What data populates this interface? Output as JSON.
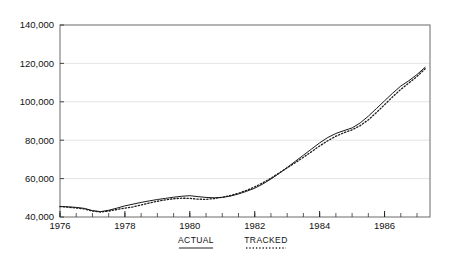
{
  "chart_data": {
    "type": "line",
    "title": "",
    "subtitle": "",
    "xlabel": "",
    "ylabel": "",
    "xlim": [
      1976.0,
      1987.4
    ],
    "ylim": [
      40000,
      140000
    ],
    "grid": true,
    "grid_axis": "y",
    "legend_position": "below-axis",
    "y_ticks": [
      40000,
      60000,
      80000,
      100000,
      120000,
      140000
    ],
    "y_tick_labels": [
      "40,000",
      "60,000",
      "80,000",
      "100,000",
      "120,000",
      "140,000"
    ],
    "x_ticks": [
      1976,
      1978,
      1980,
      1982,
      1984,
      1986
    ],
    "x_tick_labels": [
      "1976",
      "1978",
      "1980",
      "1982",
      "1984",
      "1986"
    ],
    "x_minor_tick_interval": 0.5,
    "series": [
      {
        "name": "ACTUAL",
        "style": "solid",
        "color": "#1a1a1a",
        "x": [
          1976.0,
          1976.25,
          1976.5,
          1976.75,
          1977.0,
          1977.25,
          1977.5,
          1977.75,
          1978.0,
          1978.25,
          1978.5,
          1978.75,
          1979.0,
          1979.25,
          1979.5,
          1979.75,
          1980.0,
          1980.25,
          1980.5,
          1980.75,
          1981.0,
          1981.25,
          1981.5,
          1981.75,
          1982.0,
          1982.25,
          1982.5,
          1982.75,
          1983.0,
          1983.25,
          1983.5,
          1983.75,
          1984.0,
          1984.25,
          1984.5,
          1984.75,
          1985.0,
          1985.25,
          1985.5,
          1985.75,
          1986.0,
          1986.25,
          1986.5,
          1986.75,
          1987.0,
          1987.25
        ],
        "values": [
          45500,
          45300,
          45000,
          44500,
          43300,
          42800,
          43500,
          44600,
          45800,
          46700,
          47600,
          48400,
          49100,
          49700,
          50300,
          50800,
          51100,
          50600,
          50200,
          50000,
          50200,
          50900,
          52000,
          53400,
          55000,
          57200,
          59800,
          62700,
          65800,
          69000,
          72200,
          75400,
          78600,
          81400,
          83500,
          85000,
          86400,
          89000,
          92500,
          96500,
          100500,
          104500,
          108200,
          111000,
          114200,
          118000
        ]
      },
      {
        "name": "TRACKED",
        "style": "dotted",
        "color": "#1a1a1a",
        "x": [
          1976.0,
          1976.25,
          1976.5,
          1976.75,
          1977.0,
          1977.25,
          1977.5,
          1977.75,
          1978.0,
          1978.25,
          1978.5,
          1978.75,
          1979.0,
          1979.25,
          1979.5,
          1979.75,
          1980.0,
          1980.25,
          1980.5,
          1980.75,
          1981.0,
          1981.25,
          1981.5,
          1981.75,
          1982.0,
          1982.25,
          1982.5,
          1982.75,
          1983.0,
          1983.25,
          1983.5,
          1983.75,
          1984.0,
          1984.25,
          1984.5,
          1984.75,
          1985.0,
          1985.25,
          1985.5,
          1985.75,
          1986.0,
          1986.25,
          1986.5,
          1986.75,
          1987.0,
          1987.25
        ],
        "values": [
          45400,
          45100,
          44700,
          44200,
          43100,
          42600,
          43100,
          43900,
          44600,
          45300,
          46300,
          47300,
          48200,
          48900,
          49500,
          49800,
          49700,
          49300,
          49200,
          49600,
          50300,
          51200,
          52400,
          53900,
          55700,
          57800,
          60200,
          62900,
          65600,
          68300,
          71100,
          74000,
          77000,
          79700,
          82100,
          83900,
          85400,
          87600,
          90600,
          94400,
          98500,
          102600,
          106500,
          109800,
          113200,
          117200
        ]
      }
    ],
    "legend": [
      {
        "label": "ACTUAL",
        "style": "solid"
      },
      {
        "label": "TRACKED",
        "style": "dotted"
      }
    ]
  },
  "plot_area": {
    "left": 60,
    "right": 430,
    "top": 25,
    "bottom": 217
  }
}
